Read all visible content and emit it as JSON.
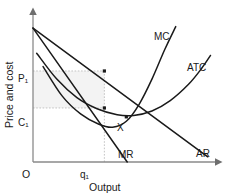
{
  "chart_data": {
    "type": "line",
    "title": "",
    "xlabel": "Output",
    "ylabel": "Price and cost",
    "grid": false,
    "legend_position": "inline-curve-labels",
    "axis_origin_label": "O",
    "xlim": [
      0,
      10
    ],
    "ylim": [
      0,
      10
    ],
    "x_ticks": [
      {
        "label": "q₁",
        "value": 3.9
      }
    ],
    "y_ticks": [
      {
        "label": "P₁",
        "value": 6.15
      },
      {
        "label": "C₁",
        "value": 3.65
      }
    ],
    "annotations": [
      {
        "label": "X",
        "x": 5.0,
        "y": 2.85
      }
    ],
    "series": [
      {
        "name": "AR",
        "label": "AR",
        "type": "line",
        "points": [
          [
            0.0,
            9.05
          ],
          [
            9.55,
            0.35
          ]
        ]
      },
      {
        "name": "MR",
        "label": "MR",
        "type": "line",
        "points": [
          [
            0.0,
            9.05
          ],
          [
            5.15,
            0.0
          ]
        ]
      },
      {
        "name": "MC",
        "label": "MC",
        "type": "curve",
        "points": [
          [
            0.55,
            6.45
          ],
          [
            1.6,
            4.45
          ],
          [
            2.6,
            3.25
          ],
          [
            3.6,
            2.55
          ],
          [
            4.35,
            2.35
          ],
          [
            5.1,
            2.75
          ],
          [
            5.8,
            3.9
          ],
          [
            6.5,
            5.6
          ],
          [
            7.2,
            7.6
          ],
          [
            7.8,
            9.15
          ]
        ]
      },
      {
        "name": "ATC",
        "label": "ATC",
        "type": "curve",
        "points": [
          [
            0.2,
            7.35
          ],
          [
            1.3,
            5.6
          ],
          [
            2.4,
            4.35
          ],
          [
            3.5,
            3.6
          ],
          [
            4.6,
            3.2
          ],
          [
            5.5,
            3.15
          ],
          [
            6.5,
            3.45
          ],
          [
            7.5,
            4.15
          ],
          [
            8.5,
            5.25
          ],
          [
            9.2,
            6.3
          ],
          [
            9.7,
            7.2
          ]
        ]
      }
    ],
    "markers": [
      {
        "name": "ar-at-q1",
        "x": 3.9,
        "y": 6.15
      },
      {
        "name": "atc-at-q1",
        "x": 3.9,
        "y": 3.65
      },
      {
        "name": "mc-atc-cross",
        "x": 5.1,
        "y": 3.05
      }
    ],
    "shaded_region": {
      "name": "profit-rectangle",
      "x_from": 0,
      "x_to": 3.9,
      "y_from": 3.65,
      "y_to": 6.15,
      "color": "#f3f3f3"
    },
    "guide_lines": [
      {
        "name": "p1-guide",
        "from": [
          0,
          6.15
        ],
        "to": [
          3.9,
          6.15
        ]
      },
      {
        "name": "c1-guide",
        "from": [
          0,
          3.65
        ],
        "to": [
          3.9,
          3.65
        ]
      },
      {
        "name": "q1-guide",
        "from": [
          3.9,
          0
        ],
        "to": [
          3.9,
          6.15
        ]
      }
    ],
    "colors": {
      "curve": "#1a1a1a",
      "axis": "#8a8a8a",
      "guide": "#b5b5b5",
      "shade": "#f3f3f3",
      "text": "#1a1a1a"
    }
  }
}
